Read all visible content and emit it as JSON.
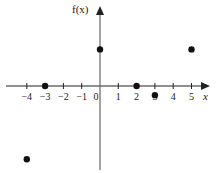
{
  "chart_data": {
    "type": "scatter",
    "title": "",
    "xlabel": "x",
    "ylabel": "f(x)",
    "x_ticks": [
      -4,
      -3,
      -2,
      -1,
      0,
      1,
      2,
      3,
      4,
      5
    ],
    "tick_labels": [
      "−4",
      "−3",
      "−2",
      "−1",
      "0",
      "1",
      "2",
      "3",
      "4",
      "5"
    ],
    "xlim": [
      -5,
      5.8
    ],
    "ylim": [
      -4.8,
      4.8
    ],
    "grid": false,
    "legend": null,
    "points": [
      {
        "x": -4,
        "y": -4
      },
      {
        "x": -3,
        "y": 0
      },
      {
        "x": 0,
        "y": 2
      },
      {
        "x": 2,
        "y": 0
      },
      {
        "x": 3,
        "y": -0.5
      },
      {
        "x": 5,
        "y": 2
      }
    ]
  },
  "labels": {
    "x_axis": "x",
    "y_axis": "f(x)"
  }
}
